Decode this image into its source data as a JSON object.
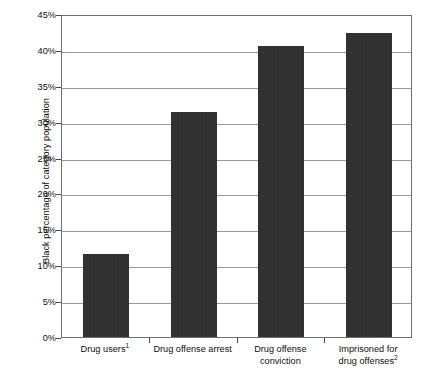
{
  "chart_data": {
    "type": "bar",
    "title": "",
    "xlabel": "",
    "ylabel": "Black percentage of category population",
    "categories": [
      "Drug users",
      "Drug offense arrest",
      "Drug offense conviction",
      "Imprisoned for drug offenses"
    ],
    "category_labels_display": [
      {
        "text": "Drug users",
        "superscript": "1",
        "lines": [
          "Drug users"
        ]
      },
      {
        "text": "Drug offense arrest",
        "superscript": "",
        "lines": [
          "Drug offense arrest"
        ]
      },
      {
        "text": "Drug offense conviction",
        "superscript": "",
        "lines": [
          "Drug offense",
          "conviction"
        ]
      },
      {
        "text": "Imprisoned for drug offenses",
        "superscript": "2",
        "lines": [
          "Imprisoned for",
          "drug offenses"
        ]
      }
    ],
    "values": [
      11.5,
      31.3,
      40.6,
      42.4
    ],
    "value_unit": "%",
    "ylim": [
      0,
      45
    ],
    "ytick_step": 5,
    "ytick_labels": [
      "0%",
      "5%",
      "10%",
      "15%",
      "20%",
      "25%",
      "30%",
      "35%",
      "40%",
      "45%"
    ],
    "ytick_values": [
      0,
      5,
      10,
      15,
      20,
      25,
      30,
      35,
      40,
      45
    ],
    "grid": true,
    "grid_axis": "y",
    "legend": false,
    "bar_color": "#2c2c2c",
    "grid_color": "#9a9a9a",
    "axis_color": "#6f6f6f",
    "background_color": "#ffffff"
  }
}
